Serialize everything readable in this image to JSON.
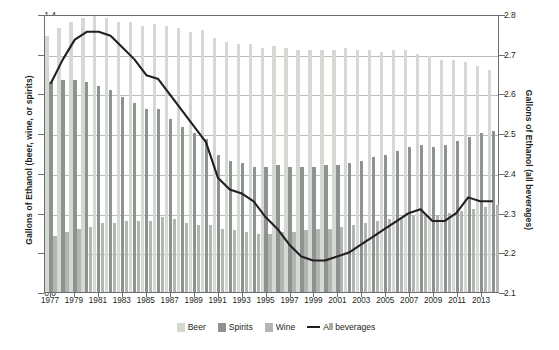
{
  "chart_data": {
    "type": "bar",
    "title": "",
    "subtitle": "",
    "xlabel": "",
    "ylabel": "Gallons of Ethanol (beer, wine, or spirits)",
    "ylabel_right": "Gallons of Ethanol (all beverages)",
    "ylim": [
      0.0,
      1.4
    ],
    "ylim_right": [
      2.1,
      2.8
    ],
    "yticks": [
      "0.0",
      "0.2",
      "0.4",
      "0.6",
      "0.8",
      "1.0",
      "1.2",
      "1.4"
    ],
    "ytick_values": [
      0.0,
      0.2,
      0.4,
      0.6,
      0.8,
      1.0,
      1.2,
      1.4
    ],
    "yticks_right": [
      "2.1",
      "2.2",
      "2.3",
      "2.4",
      "2.5",
      "2.6",
      "2.7",
      "2.8"
    ],
    "ytick_values_right": [
      2.1,
      2.2,
      2.3,
      2.4,
      2.5,
      2.6,
      2.7,
      2.8
    ],
    "grid": true,
    "legend_position": "bottom",
    "categories": [
      "1977",
      "1978",
      "1979",
      "1980",
      "1981",
      "1982",
      "1983",
      "1984",
      "1985",
      "1986",
      "1987",
      "1988",
      "1989",
      "1990",
      "1991",
      "1992",
      "1993",
      "1994",
      "1995",
      "1996",
      "1997",
      "1998",
      "1999",
      "2000",
      "2001",
      "2002",
      "2003",
      "2004",
      "2005",
      "2006",
      "2007",
      "2008",
      "2009",
      "2010",
      "2011",
      "2012",
      "2013",
      "2014"
    ],
    "xtick_labels": [
      "1977",
      "1979",
      "1981",
      "1983",
      "1985",
      "1987",
      "1989",
      "1991",
      "1993",
      "1995",
      "1997",
      "1999",
      "2001",
      "2003",
      "2005",
      "2007",
      "2009",
      "2011",
      "2013"
    ],
    "series": [
      {
        "name": "Beer",
        "color": "#d6d8d4",
        "axis": "left",
        "values": [
          1.29,
          1.33,
          1.36,
          1.38,
          1.39,
          1.38,
          1.36,
          1.36,
          1.34,
          1.35,
          1.34,
          1.33,
          1.31,
          1.32,
          1.28,
          1.26,
          1.25,
          1.25,
          1.23,
          1.24,
          1.23,
          1.22,
          1.22,
          1.22,
          1.22,
          1.23,
          1.22,
          1.22,
          1.21,
          1.22,
          1.22,
          1.2,
          1.19,
          1.17,
          1.17,
          1.16,
          1.14,
          1.12
        ]
      },
      {
        "name": "Spirits",
        "color": "#8d9490",
        "axis": "left",
        "values": [
          1.06,
          1.07,
          1.07,
          1.06,
          1.04,
          1.02,
          0.98,
          0.95,
          0.92,
          0.92,
          0.87,
          0.83,
          0.8,
          0.77,
          0.69,
          0.66,
          0.65,
          0.63,
          0.63,
          0.64,
          0.63,
          0.63,
          0.63,
          0.64,
          0.64,
          0.65,
          0.66,
          0.68,
          0.69,
          0.71,
          0.73,
          0.74,
          0.73,
          0.74,
          0.76,
          0.78,
          0.8,
          0.81
        ]
      },
      {
        "name": "Wine",
        "color": "#b2b6b2",
        "axis": "left",
        "values": [
          0.28,
          0.3,
          0.32,
          0.33,
          0.35,
          0.35,
          0.36,
          0.36,
          0.36,
          0.38,
          0.37,
          0.35,
          0.34,
          0.34,
          0.32,
          0.31,
          0.3,
          0.29,
          0.29,
          0.3,
          0.3,
          0.31,
          0.32,
          0.32,
          0.33,
          0.34,
          0.35,
          0.36,
          0.37,
          0.38,
          0.39,
          0.39,
          0.39,
          0.4,
          0.41,
          0.42,
          0.43,
          0.44
        ]
      }
    ],
    "line_series": {
      "name": "All beverages",
      "color": "#231f20",
      "axis": "right",
      "values": [
        2.63,
        2.69,
        2.74,
        2.76,
        2.76,
        2.75,
        2.72,
        2.69,
        2.65,
        2.64,
        2.6,
        2.56,
        2.52,
        2.48,
        2.39,
        2.36,
        2.35,
        2.33,
        2.29,
        2.26,
        2.22,
        2.19,
        2.18,
        2.18,
        2.19,
        2.2,
        2.22,
        2.24,
        2.26,
        2.28,
        2.3,
        2.31,
        2.28,
        2.28,
        2.3,
        2.34,
        2.33,
        2.33
      ]
    },
    "legend": [
      {
        "label": "Beer",
        "type": "swatch",
        "color": "#d6d8d4"
      },
      {
        "label": "Spirits",
        "type": "swatch",
        "color": "#8d9490"
      },
      {
        "label": "Wine",
        "type": "swatch",
        "color": "#b2b6b2"
      },
      {
        "label": "All beverages",
        "type": "line",
        "color": "#231f20"
      }
    ]
  }
}
